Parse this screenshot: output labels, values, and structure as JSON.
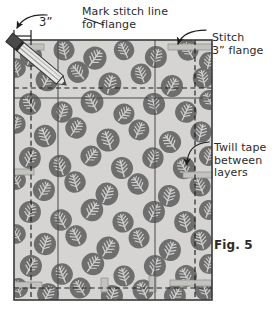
{
  "figure": {
    "id": "Fig. 5"
  },
  "annotations": {
    "flange_width": "3”",
    "mark_stitch_line": "Mark stitch line\nfor flange",
    "stitch_flange": "Stitch\n3” flange",
    "twill_tape": "Twill tape\nbetween\nlayers",
    "figure_caption": "Fig. 5"
  },
  "colors": {
    "fabric_base": "#d5d4d2",
    "fabric_motif": "#6e6e6e",
    "motif_vein": "#cfcfcd",
    "twill_tape": "#c2c2bf",
    "outline": "#3a3a3a",
    "dashed_line": "#1f1f1f",
    "seam_line": "#4a4a4a",
    "text": "#2b2b2b",
    "pencil_body": "#e8e8e6",
    "pencil_cap": "#4a4a4a",
    "background": "#ffffff"
  },
  "panel": {
    "x": 14,
    "y": 40,
    "width": 198,
    "height": 260
  },
  "guides": {
    "vertical_dashed": [
      31,
      195
    ],
    "vertical_solid": [
      58,
      155
    ],
    "horizontal_dashed": [
      88,
      288
    ],
    "horizontal_solid": [
      98
    ]
  },
  "twill_tape_bars": [
    {
      "x": 14,
      "y": 44,
      "w": 30,
      "h": 6,
      "orient": "horizontal"
    },
    {
      "x": 168,
      "y": 44,
      "w": 44,
      "h": 6,
      "orient": "horizontal"
    },
    {
      "x": 14,
      "y": 169,
      "w": 20,
      "h": 6,
      "orient": "horizontal"
    },
    {
      "x": 183,
      "y": 172,
      "w": 29,
      "h": 6,
      "orient": "horizontal"
    },
    {
      "x": 14,
      "y": 282,
      "w": 28,
      "h": 6,
      "orient": "horizontal"
    },
    {
      "x": 170,
      "y": 280,
      "w": 42,
      "h": 6,
      "orient": "horizontal"
    },
    {
      "x": 101,
      "y": 278,
      "w": 7,
      "h": 14,
      "orient": "vertical"
    },
    {
      "x": 149,
      "y": 276,
      "w": 7,
      "h": 16,
      "orient": "vertical"
    }
  ],
  "dimension_marker": {
    "label": "3”",
    "x1": 14,
    "x2": 31,
    "y": 36
  },
  "arrows": [
    {
      "name": "flange-width-arrow",
      "target": "top-left-edge"
    },
    {
      "name": "mark-stitch-arrow",
      "target": "pencil-tip"
    },
    {
      "name": "stitch-flange-arrow",
      "target": "top-right-tape"
    },
    {
      "name": "twill-tape-arrow",
      "target": "right-mid-tape"
    }
  ],
  "pencil": {
    "name": "marking-pencil",
    "tip_x": 66,
    "tip_y": 85,
    "cap_x": 118,
    "cap_y": 24
  },
  "motifs": [
    {
      "x": 31,
      "y": 56,
      "r": 22,
      "s": 1.0
    },
    {
      "x": 64,
      "y": 50,
      "r": -14,
      "s": 0.95
    },
    {
      "x": 95,
      "y": 58,
      "r": 35,
      "s": 1.05
    },
    {
      "x": 124,
      "y": 50,
      "r": -25,
      "s": 0.92
    },
    {
      "x": 156,
      "y": 57,
      "r": 18,
      "s": 1.0
    },
    {
      "x": 188,
      "y": 50,
      "r": -32,
      "s": 0.96
    },
    {
      "x": 209,
      "y": 62,
      "r": 12,
      "s": 0.9
    },
    {
      "x": 16,
      "y": 68,
      "r": -18,
      "s": 0.88
    },
    {
      "x": 47,
      "y": 80,
      "r": 28,
      "s": 1.02
    },
    {
      "x": 78,
      "y": 72,
      "r": -40,
      "s": 0.98
    },
    {
      "x": 110,
      "y": 84,
      "r": 15,
      "s": 1.04
    },
    {
      "x": 141,
      "y": 74,
      "r": -20,
      "s": 0.94
    },
    {
      "x": 172,
      "y": 86,
      "r": 30,
      "s": 1.0
    },
    {
      "x": 203,
      "y": 78,
      "r": -12,
      "s": 0.93
    },
    {
      "x": 30,
      "y": 104,
      "r": -35,
      "s": 1.0
    },
    {
      "x": 62,
      "y": 112,
      "r": 20,
      "s": 0.97
    },
    {
      "x": 92,
      "y": 102,
      "r": -28,
      "s": 1.03
    },
    {
      "x": 124,
      "y": 114,
      "r": 40,
      "s": 0.95
    },
    {
      "x": 154,
      "y": 104,
      "r": -15,
      "s": 1.0
    },
    {
      "x": 186,
      "y": 112,
      "r": 25,
      "s": 0.98
    },
    {
      "x": 209,
      "y": 100,
      "r": -30,
      "s": 0.9
    },
    {
      "x": 16,
      "y": 124,
      "r": 16,
      "s": 0.88
    },
    {
      "x": 45,
      "y": 136,
      "r": -22,
      "s": 1.01
    },
    {
      "x": 76,
      "y": 128,
      "r": 33,
      "s": 0.96
    },
    {
      "x": 108,
      "y": 140,
      "r": -18,
      "s": 1.05
    },
    {
      "x": 139,
      "y": 130,
      "r": 22,
      "s": 0.94
    },
    {
      "x": 170,
      "y": 142,
      "r": -36,
      "s": 1.0
    },
    {
      "x": 201,
      "y": 132,
      "r": 14,
      "s": 0.96
    },
    {
      "x": 30,
      "y": 158,
      "r": 26,
      "s": 0.99
    },
    {
      "x": 60,
      "y": 166,
      "r": -20,
      "s": 1.02
    },
    {
      "x": 91,
      "y": 156,
      "r": 38,
      "s": 0.95
    },
    {
      "x": 122,
      "y": 168,
      "r": -14,
      "s": 1.0
    },
    {
      "x": 153,
      "y": 158,
      "r": 20,
      "s": 0.97
    },
    {
      "x": 184,
      "y": 168,
      "r": -30,
      "s": 1.01
    },
    {
      "x": 209,
      "y": 156,
      "r": 18,
      "s": 0.9
    },
    {
      "x": 16,
      "y": 180,
      "r": -24,
      "s": 0.89
    },
    {
      "x": 44,
      "y": 190,
      "r": 30,
      "s": 1.0
    },
    {
      "x": 75,
      "y": 182,
      "r": -16,
      "s": 0.97
    },
    {
      "x": 107,
      "y": 194,
      "r": 24,
      "s": 1.03
    },
    {
      "x": 138,
      "y": 184,
      "r": -34,
      "s": 0.96
    },
    {
      "x": 169,
      "y": 196,
      "r": 16,
      "s": 1.0
    },
    {
      "x": 200,
      "y": 186,
      "r": -22,
      "s": 0.95
    },
    {
      "x": 30,
      "y": 212,
      "r": 20,
      "s": 1.0
    },
    {
      "x": 61,
      "y": 220,
      "r": -28,
      "s": 0.98
    },
    {
      "x": 92,
      "y": 210,
      "r": 34,
      "s": 1.02
    },
    {
      "x": 123,
      "y": 222,
      "r": -18,
      "s": 0.96
    },
    {
      "x": 154,
      "y": 212,
      "r": 26,
      "s": 1.0
    },
    {
      "x": 185,
      "y": 222,
      "r": -14,
      "s": 0.99
    },
    {
      "x": 209,
      "y": 210,
      "r": 22,
      "s": 0.9
    },
    {
      "x": 16,
      "y": 234,
      "r": -30,
      "s": 0.88
    },
    {
      "x": 45,
      "y": 244,
      "r": 18,
      "s": 1.01
    },
    {
      "x": 76,
      "y": 236,
      "r": -26,
      "s": 0.97
    },
    {
      "x": 108,
      "y": 248,
      "r": 32,
      "s": 1.04
    },
    {
      "x": 139,
      "y": 238,
      "r": -20,
      "s": 0.95
    },
    {
      "x": 170,
      "y": 250,
      "r": 24,
      "s": 1.0
    },
    {
      "x": 201,
      "y": 240,
      "r": -16,
      "s": 0.96
    },
    {
      "x": 31,
      "y": 266,
      "r": 28,
      "s": 1.0
    },
    {
      "x": 62,
      "y": 274,
      "r": -22,
      "s": 0.98
    },
    {
      "x": 93,
      "y": 264,
      "r": 36,
      "s": 1.02
    },
    {
      "x": 124,
      "y": 276,
      "r": -16,
      "s": 0.96
    },
    {
      "x": 155,
      "y": 266,
      "r": 20,
      "s": 1.0
    },
    {
      "x": 186,
      "y": 276,
      "r": -28,
      "s": 0.99
    },
    {
      "x": 209,
      "y": 264,
      "r": 14,
      "s": 0.9
    },
    {
      "x": 18,
      "y": 288,
      "r": -20,
      "s": 0.9
    },
    {
      "x": 48,
      "y": 294,
      "r": 26,
      "s": 0.98
    },
    {
      "x": 80,
      "y": 288,
      "r": -32,
      "s": 0.94
    },
    {
      "x": 112,
      "y": 296,
      "r": 18,
      "s": 1.0
    },
    {
      "x": 143,
      "y": 290,
      "r": -24,
      "s": 0.96
    },
    {
      "x": 175,
      "y": 296,
      "r": 30,
      "s": 0.99
    },
    {
      "x": 205,
      "y": 290,
      "r": -18,
      "s": 0.93
    }
  ]
}
